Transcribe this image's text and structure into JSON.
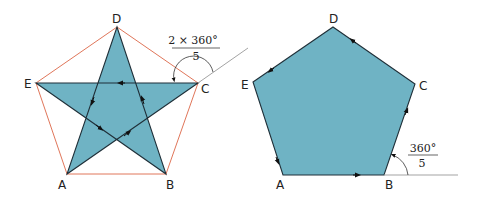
{
  "left_figure": {
    "name": "pentagram",
    "fill": "#6fb3c4",
    "stroke": "#1f2f38",
    "circumscribed_pentagon_stroke": "#e0765a",
    "vertices": {
      "D": {
        "label": "D",
        "x": 117,
        "y": 27
      },
      "E": {
        "label": "E",
        "x": 36,
        "y": 83
      },
      "C": {
        "label": "C",
        "x": 198,
        "y": 83
      },
      "A": {
        "label": "A",
        "x": 67,
        "y": 174
      },
      "B": {
        "label": "B",
        "x": 166,
        "y": 174
      }
    },
    "angle_label": {
      "numerator": "2 × 360°",
      "denominator": "5"
    }
  },
  "right_figure": {
    "name": "pentagon",
    "fill": "#6fb3c4",
    "stroke": "#1f2f38",
    "vertices": {
      "D": {
        "label": "D",
        "x": 333,
        "y": 27
      },
      "E": {
        "label": "E",
        "x": 253,
        "y": 82
      },
      "C": {
        "label": "C",
        "x": 415,
        "y": 84
      },
      "A": {
        "label": "A",
        "x": 283,
        "y": 175
      },
      "B": {
        "label": "B",
        "x": 384,
        "y": 175
      }
    },
    "angle_label": {
      "numerator": "360°",
      "denominator": "5"
    }
  }
}
